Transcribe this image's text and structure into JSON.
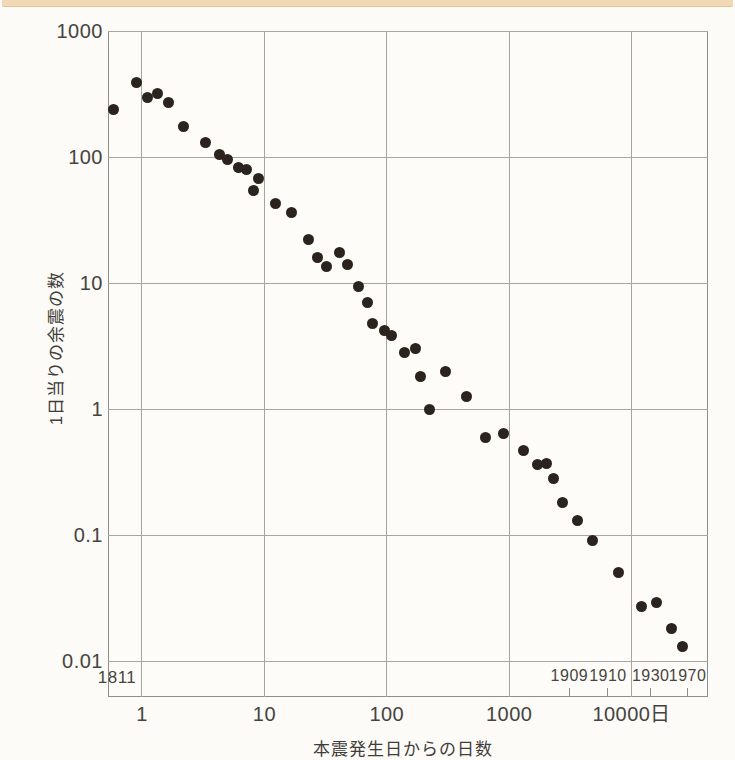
{
  "chart_data": {
    "type": "scatter",
    "title": "",
    "xlabel": "本震発生日からの日数",
    "ylabel": "1日当りの余震の数",
    "x_scale": "log",
    "y_scale": "log",
    "xlim": [
      0.528,
      42000
    ],
    "ylim": [
      0.00518,
      1000
    ],
    "grid": true,
    "legend": "none",
    "x_ticks": [
      {
        "value": 1,
        "label": "1"
      },
      {
        "value": 10,
        "label": "10"
      },
      {
        "value": 100,
        "label": "100"
      },
      {
        "value": 1000,
        "label": "1000"
      },
      {
        "value": 10000,
        "label": "10000日"
      }
    ],
    "y_ticks": [
      {
        "value": 1000,
        "label": "1000"
      },
      {
        "value": 100,
        "label": "100"
      },
      {
        "value": 10,
        "label": "10"
      },
      {
        "value": 1,
        "label": "1"
      },
      {
        "value": 0.1,
        "label": "0.1"
      },
      {
        "value": 0.01,
        "label": "0.01"
      }
    ],
    "origin_year_label": "1811",
    "year_annotations": [
      {
        "label": "1909",
        "days": 3100
      },
      {
        "label": "1910",
        "days": 6400
      },
      {
        "label": "1930",
        "days": 14300
      },
      {
        "label": "1970",
        "days": 28600
      }
    ],
    "points_days_vs_aftershocks_per_day": [
      [
        0.59,
        240
      ],
      [
        0.9,
        390
      ],
      [
        1.1,
        295
      ],
      [
        1.35,
        320
      ],
      [
        1.65,
        270
      ],
      [
        2.2,
        175
      ],
      [
        3.3,
        130
      ],
      [
        4.3,
        105
      ],
      [
        5.0,
        95
      ],
      [
        6.1,
        83
      ],
      [
        7.1,
        80
      ],
      [
        8.2,
        54
      ],
      [
        9.0,
        68
      ],
      [
        12.4,
        43
      ],
      [
        16.8,
        36
      ],
      [
        23,
        22
      ],
      [
        27,
        16
      ],
      [
        32,
        13.5
      ],
      [
        41,
        17.5
      ],
      [
        48,
        14
      ],
      [
        59,
        9.3
      ],
      [
        69,
        7.0
      ],
      [
        77,
        4.8
      ],
      [
        96,
        4.2
      ],
      [
        110,
        3.8
      ],
      [
        140,
        2.8
      ],
      [
        170,
        3.0
      ],
      [
        190,
        1.8
      ],
      [
        225,
        1.0
      ],
      [
        300,
        2.0
      ],
      [
        450,
        1.25
      ],
      [
        640,
        0.59
      ],
      [
        900,
        0.64
      ],
      [
        1300,
        0.47
      ],
      [
        1700,
        0.36
      ],
      [
        2000,
        0.37
      ],
      [
        2300,
        0.28
      ],
      [
        2700,
        0.18
      ],
      [
        3600,
        0.13
      ],
      [
        4800,
        0.09
      ],
      [
        7800,
        0.05
      ],
      [
        12000,
        0.027
      ],
      [
        16000,
        0.029
      ],
      [
        21000,
        0.018
      ],
      [
        26000,
        0.013
      ]
    ],
    "colors": {
      "point": "#2a231e",
      "grid": "#a6a6a0",
      "frame": "#8f8f89",
      "text": "#454340",
      "page_band": "#f2d9b5"
    }
  }
}
